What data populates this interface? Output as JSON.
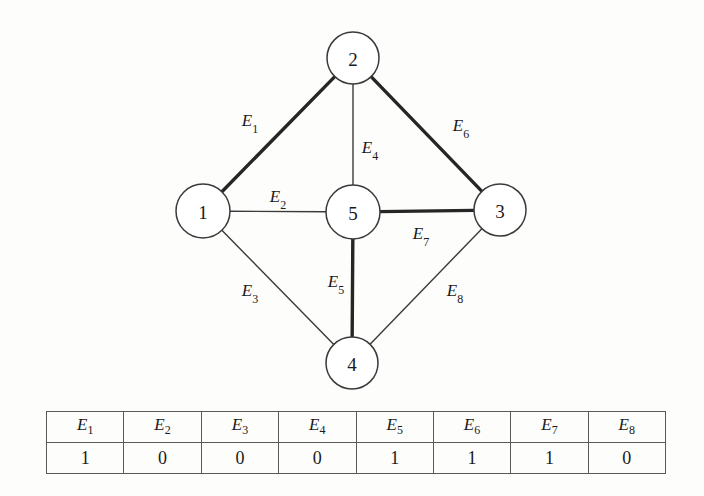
{
  "figure": {
    "background": "#fdfdfc",
    "stroke_color": "#3a3a3a",
    "thick_stroke_color": "#262626"
  },
  "graph": {
    "nodes": [
      {
        "id": "2",
        "label": "2",
        "cx": 353,
        "cy": 58,
        "r": 26
      },
      {
        "id": "1",
        "label": "1",
        "cx": 203,
        "cy": 211,
        "r": 27
      },
      {
        "id": "5",
        "label": "5",
        "cx": 353,
        "cy": 212,
        "r": 27
      },
      {
        "id": "3",
        "label": "3",
        "cx": 500,
        "cy": 210,
        "r": 26
      },
      {
        "id": "4",
        "label": "4",
        "cx": 352,
        "cy": 363,
        "r": 26
      }
    ],
    "edges": [
      {
        "id": "E1",
        "label": "E",
        "sub": "1",
        "from": "1",
        "to": "2",
        "weight": "thick",
        "label_x": 250,
        "label_y": 120
      },
      {
        "id": "E2",
        "label": "E",
        "sub": "2",
        "from": "1",
        "to": "5",
        "weight": "thin",
        "label_x": 278,
        "label_y": 196
      },
      {
        "id": "E3",
        "label": "E",
        "sub": "3",
        "from": "1",
        "to": "4",
        "weight": "thin",
        "label_x": 250,
        "label_y": 290
      },
      {
        "id": "E4",
        "label": "E",
        "sub": "4",
        "from": "2",
        "to": "5",
        "weight": "thin",
        "label_x": 370,
        "label_y": 147
      },
      {
        "id": "E5",
        "label": "E",
        "sub": "5",
        "from": "5",
        "to": "4",
        "weight": "thick",
        "label_x": 336,
        "label_y": 281
      },
      {
        "id": "E6",
        "label": "E",
        "sub": "6",
        "from": "2",
        "to": "3",
        "weight": "thick",
        "label_x": 461,
        "label_y": 125
      },
      {
        "id": "E7",
        "label": "E",
        "sub": "7",
        "from": "5",
        "to": "3",
        "weight": "thick",
        "label_x": 421,
        "label_y": 233
      },
      {
        "id": "E8",
        "label": "E",
        "sub": "8",
        "from": "3",
        "to": "4",
        "weight": "thin",
        "label_x": 455,
        "label_y": 290
      }
    ]
  },
  "table": {
    "headers": [
      "E1",
      "E2",
      "E3",
      "E4",
      "E5",
      "E6",
      "E7",
      "E8"
    ],
    "header_base": "E",
    "header_subs": [
      "1",
      "2",
      "3",
      "4",
      "5",
      "6",
      "7",
      "8"
    ],
    "values": [
      "1",
      "0",
      "0",
      "0",
      "1",
      "1",
      "1",
      "0"
    ]
  }
}
